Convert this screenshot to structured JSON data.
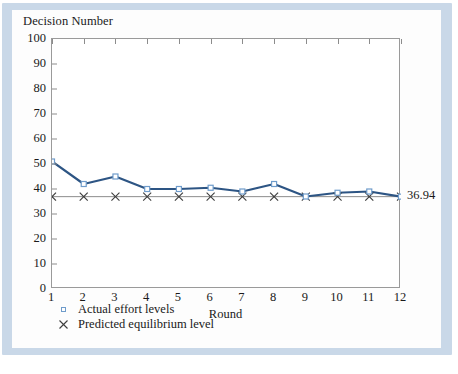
{
  "figure": {
    "y_axis_title": "Decision Number",
    "x_axis_title": "Round",
    "end_label": "36.94"
  },
  "legend": {
    "items": [
      {
        "marker": "square-marker-icon",
        "label": "Actual effort levels"
      },
      {
        "marker": "cross-marker-icon",
        "label": "Predicted equilibrium level"
      }
    ]
  },
  "colors": {
    "line": "#2d5584",
    "marker_edge": "#6f9ccb",
    "equilibrium_line": "#8c8c8c",
    "axis": "#9a9a9a",
    "frame": "#c9d8e8",
    "text": "#1a1a1a"
  },
  "chart_data": {
    "type": "line",
    "title": "",
    "xlabel": "Round",
    "ylabel": "Decision Number",
    "xlim": [
      1,
      12
    ],
    "ylim": [
      0,
      100
    ],
    "grid": false,
    "legend_position": "below-plot-left",
    "x": [
      1,
      2,
      3,
      4,
      5,
      6,
      7,
      8,
      9,
      10,
      11,
      12
    ],
    "yticks": [
      0,
      10,
      20,
      30,
      40,
      50,
      60,
      70,
      80,
      90,
      100
    ],
    "xticks": [
      1,
      2,
      3,
      4,
      5,
      6,
      7,
      8,
      9,
      10,
      11,
      12
    ],
    "series": [
      {
        "name": "Actual effort levels",
        "marker": "square",
        "values": [
          51,
          42,
          45,
          40,
          40,
          40.5,
          39,
          42,
          37,
          38.5,
          39,
          36.94
        ]
      },
      {
        "name": "Predicted equilibrium level",
        "marker": "x",
        "values": [
          36.94,
          36.94,
          36.94,
          36.94,
          36.94,
          36.94,
          36.94,
          36.94,
          36.94,
          36.94,
          36.94,
          36.94
        ]
      }
    ],
    "annotations": [
      {
        "text": "36.94",
        "x": 12,
        "y": 36.94,
        "position": "right-of-axis"
      }
    ]
  }
}
